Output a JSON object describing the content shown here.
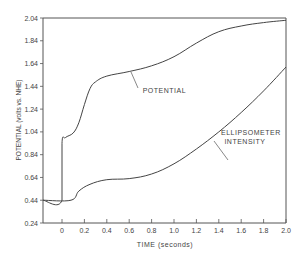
{
  "chart_data": {
    "type": "line",
    "title": "",
    "xlabel": "TIME (seconds)",
    "ylabel": "POTENTIAL (volts vs. NHE)",
    "xlim": [
      -0.17,
      2.0
    ],
    "ylim": [
      0.24,
      2.04
    ],
    "x_ticks": [
      "0",
      "0.2",
      "0.4",
      "0.6",
      "0.8",
      "1.0",
      "1.2",
      "1.4",
      "1.6",
      "1.8",
      "2.0"
    ],
    "y_ticks": [
      "0.24",
      "0.44",
      "0.64",
      "0.84",
      "1.04",
      "1.24",
      "1.44",
      "1.64",
      "1.84",
      "2.04"
    ],
    "grid": false,
    "legend": "inline annotations",
    "series": [
      {
        "name": "POTENTIAL",
        "x": [
          -0.17,
          0.0,
          0.0,
          0.03,
          0.1,
          0.15,
          0.2,
          0.25,
          0.3,
          0.4,
          0.6,
          0.8,
          1.0,
          1.2,
          1.4,
          1.6,
          1.8,
          2.0
        ],
        "y": [
          0.44,
          0.44,
          0.94,
          0.99,
          1.03,
          1.12,
          1.28,
          1.42,
          1.48,
          1.53,
          1.57,
          1.62,
          1.7,
          1.82,
          1.92,
          1.97,
          2.0,
          2.02
        ]
      },
      {
        "name": "ELLIPSOMETER INTENSITY",
        "x": [
          -0.17,
          0.08,
          0.15,
          0.25,
          0.4,
          0.6,
          0.8,
          1.0,
          1.2,
          1.4,
          1.6,
          1.8,
          2.0
        ],
        "y": [
          0.44,
          0.44,
          0.52,
          0.58,
          0.62,
          0.63,
          0.67,
          0.76,
          0.89,
          1.04,
          1.21,
          1.4,
          1.61
        ]
      }
    ],
    "annotations": [
      {
        "text": "POTENTIAL",
        "x": 0.72,
        "y": 1.38
      },
      {
        "text": "ELLIPSOMETER",
        "x": 1.42,
        "y": 1.01
      },
      {
        "text": "INTENSITY",
        "x": 1.45,
        "y": 0.93
      }
    ]
  }
}
